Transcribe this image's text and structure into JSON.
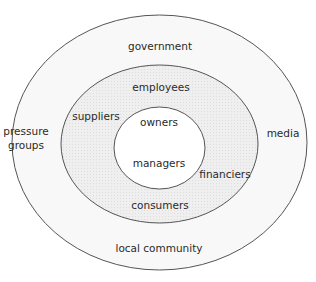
{
  "diagram": {
    "type": "stakeholder-concentric-ellipses",
    "colors": {
      "outer_fill": "#f6f6f6",
      "middle_fill": "#ececec",
      "inner_fill": "#ffffff",
      "stroke": "#555555",
      "text": "#2a2a2a"
    },
    "outer_ring": {
      "name": "external stakeholders",
      "labels": {
        "top": "government",
        "left_line1": "pressure",
        "left_line2": "groups",
        "right": "media",
        "bottom": "local community"
      }
    },
    "middle_ring": {
      "name": "connected stakeholders",
      "labels": {
        "top": "employees",
        "left": "suppliers",
        "right": "financiers",
        "bottom": "consumers"
      }
    },
    "inner_core": {
      "name": "internal stakeholders",
      "labels": {
        "top": "owners",
        "bottom": "managers"
      }
    }
  }
}
